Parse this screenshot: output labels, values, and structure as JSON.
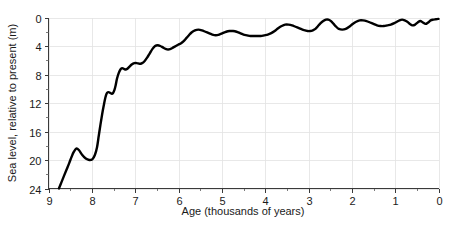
{
  "chart_data": {
    "type": "line",
    "title": "",
    "xlabel": "Age (thousands of years)",
    "ylabel": "Sea level, relative to present (m)",
    "xlim": [
      9,
      0
    ],
    "ylim": [
      24,
      0
    ],
    "x_axis_inverted": true,
    "y_axis_inverted": true,
    "grid": true,
    "legend": null,
    "x_ticks": [
      9,
      8,
      7,
      6,
      5,
      4,
      3,
      2,
      1,
      0
    ],
    "x_tick_labels": [
      "9",
      "8",
      "7",
      "6",
      "5",
      "4",
      "3",
      "2",
      "1",
      "0"
    ],
    "x_minor_tick_step": 0.5,
    "y_ticks": [
      0,
      4,
      8,
      12,
      16,
      20,
      24
    ],
    "y_tick_labels": [
      "0",
      "4",
      "8",
      "12",
      "16",
      "20",
      "24"
    ],
    "y_minor_tick_step": 2,
    "line_color": "#000000",
    "grid_color": "#e2e2e2",
    "axis_color": "#3a3a3a",
    "series": [
      {
        "name": "Sea level",
        "x": [
          8.76,
          8.7,
          8.64,
          8.58,
          8.52,
          8.47,
          8.42,
          8.36,
          8.3,
          8.22,
          8.14,
          8.06,
          7.99,
          7.93,
          7.88,
          7.84,
          7.8,
          7.76,
          7.72,
          7.69,
          7.66,
          7.63,
          7.6,
          7.57,
          7.54,
          7.51,
          7.48,
          7.45,
          7.42,
          7.38,
          7.34,
          7.3,
          7.26,
          7.22,
          7.18,
          7.13,
          7.08,
          7.02,
          6.96,
          6.9,
          6.84,
          6.78,
          6.72,
          6.66,
          6.6,
          6.54,
          6.48,
          6.42,
          6.36,
          6.3,
          6.24,
          6.18,
          6.12,
          6.06,
          6.0,
          5.94,
          5.88,
          5.82,
          5.76,
          5.7,
          5.62,
          5.54,
          5.46,
          5.38,
          5.3,
          5.22,
          5.14,
          5.06,
          4.98,
          4.9,
          4.82,
          4.74,
          4.66,
          4.58,
          4.5,
          4.42,
          4.34,
          4.26,
          4.18,
          4.1,
          4.02,
          3.94,
          3.86,
          3.78,
          3.7,
          3.62,
          3.54,
          3.46,
          3.38,
          3.3,
          3.22,
          3.14,
          3.08,
          3.02,
          2.96,
          2.9,
          2.84,
          2.78,
          2.72,
          2.66,
          2.6,
          2.54,
          2.48,
          2.42,
          2.36,
          2.3,
          2.22,
          2.14,
          2.06,
          1.98,
          1.9,
          1.82,
          1.74,
          1.66,
          1.58,
          1.5,
          1.42,
          1.34,
          1.26,
          1.18,
          1.1,
          1.02,
          0.96,
          0.9,
          0.84,
          0.78,
          0.72,
          0.66,
          0.6,
          0.54,
          0.48,
          0.42,
          0.36,
          0.3,
          0.24,
          0.18,
          0.12,
          0.06,
          0.0
        ],
        "y": [
          24.0,
          23.1,
          22.2,
          21.3,
          20.4,
          19.6,
          18.9,
          18.4,
          18.6,
          19.3,
          19.8,
          20.0,
          19.9,
          19.3,
          18.2,
          16.6,
          15.0,
          13.5,
          12.2,
          11.3,
          10.7,
          10.5,
          10.5,
          10.6,
          10.7,
          10.6,
          10.2,
          9.5,
          8.6,
          7.8,
          7.3,
          7.1,
          7.2,
          7.3,
          7.2,
          6.9,
          6.6,
          6.4,
          6.4,
          6.5,
          6.4,
          6.1,
          5.6,
          5.0,
          4.4,
          4.0,
          3.9,
          4.0,
          4.2,
          4.4,
          4.5,
          4.4,
          4.2,
          4.0,
          3.8,
          3.6,
          3.3,
          2.9,
          2.5,
          2.1,
          1.8,
          1.7,
          1.8,
          2.0,
          2.2,
          2.4,
          2.5,
          2.4,
          2.2,
          2.0,
          1.9,
          1.9,
          2.0,
          2.2,
          2.4,
          2.5,
          2.6,
          2.6,
          2.6,
          2.6,
          2.5,
          2.4,
          2.2,
          1.9,
          1.5,
          1.2,
          1.0,
          1.0,
          1.1,
          1.3,
          1.5,
          1.7,
          1.8,
          1.9,
          1.9,
          1.8,
          1.6,
          1.2,
          0.8,
          0.5,
          0.3,
          0.3,
          0.5,
          0.9,
          1.3,
          1.6,
          1.7,
          1.6,
          1.3,
          0.9,
          0.6,
          0.4,
          0.4,
          0.5,
          0.7,
          0.9,
          1.1,
          1.2,
          1.2,
          1.1,
          1.0,
          0.8,
          0.6,
          0.4,
          0.3,
          0.4,
          0.6,
          0.9,
          1.1,
          1.0,
          0.7,
          0.5,
          0.7,
          0.9,
          0.7,
          0.4,
          0.3,
          0.25,
          0.2
        ]
      }
    ]
  },
  "axes": {
    "x_title": "Age (thousands of years)",
    "y_title": "Sea level, relative to present (m)"
  }
}
